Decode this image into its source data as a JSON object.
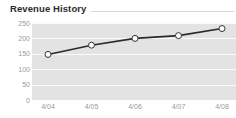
{
  "widget": {
    "title": "Revenue History",
    "has_title_rule": true
  },
  "colors": {
    "title_text": "#2b2b2b",
    "title_rule": "#d8d8d8",
    "plot_background": "#e3e3e3",
    "gridline": "#fbfbfb",
    "line": "#2a2a2a",
    "marker_fill": "#ffffff",
    "marker_stroke": "#333333",
    "tick_label": "#9a9a9a",
    "page_background": "#ffffff"
  },
  "chart_data": {
    "type": "line",
    "title": "Revenue History",
    "xlabel": "",
    "ylabel": "",
    "categories": [
      "4/04",
      "4/05",
      "4/06",
      "4/07",
      "4/08"
    ],
    "values": [
      148,
      178,
      200,
      209,
      232
    ],
    "series": [
      {
        "name": "Revenue",
        "values": [
          148,
          178,
          200,
          209,
          232
        ]
      }
    ],
    "ylim": [
      0,
      250
    ],
    "yticks": [
      0,
      50,
      100,
      150,
      200,
      250
    ],
    "ytick_labels": [
      "0",
      "50",
      "100",
      "150",
      "200",
      "250"
    ],
    "xtick_labels": [
      "4/04",
      "4/05",
      "4/06",
      "4/07",
      "4/08"
    ],
    "grid": true,
    "grid_orientation": "horizontal",
    "legend": false,
    "legend_position": "none",
    "markers": "open-circle",
    "line_width": 1.6,
    "marker_size": 3
  }
}
